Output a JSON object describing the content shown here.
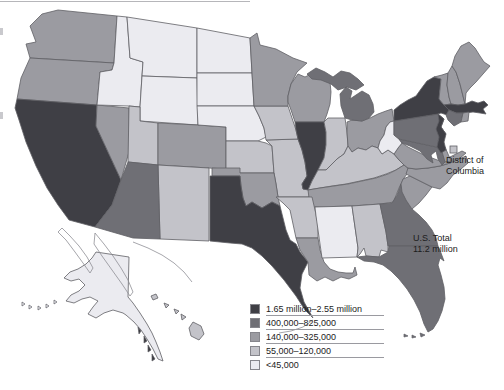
{
  "legend": {
    "items": [
      {
        "label": "1.65 million–2.55 million",
        "color": "#3f3f45"
      },
      {
        "label": "400,000–825,000",
        "color": "#6f6f75"
      },
      {
        "label": "140,000–325,000",
        "color": "#9b9ba1"
      },
      {
        "label": "55,000–120,000",
        "color": "#c3c3c9"
      },
      {
        "label": "<45,000",
        "color": "#ebebf0"
      }
    ]
  },
  "callouts": {
    "dc": {
      "line1": "District of",
      "line2": "Columbia"
    },
    "total": {
      "line1": "U.S. Total",
      "line2": "11.2 million"
    }
  },
  "map": {
    "stroke_color": "#5f5f65",
    "outline_color": "#8f8f95",
    "background": "#ffffff",
    "categories": {
      "CA": 1,
      "TX": 1,
      "NY": 1,
      "NJ": 1,
      "MA": 1,
      "IL": 1,
      "AZ": 2,
      "FL": 2,
      "GA": 2,
      "PA": 2,
      "MI": 2,
      "CT": 2,
      "MD": 2,
      "WA": 3,
      "OR": 3,
      "NV": 3,
      "CO": 3,
      "OK": 3,
      "MN": 3,
      "WI": 3,
      "OH": 3,
      "TN": 3,
      "VA": 3,
      "NC": 3,
      "SC": 3,
      "LA": 3,
      "ME": 3,
      "NH": 3,
      "VT": 3,
      "RI": 3,
      "DE": 3,
      "UT": 4,
      "NM": 4,
      "KS": 4,
      "IA": 4,
      "MO": 4,
      "IN": 4,
      "KY": 4,
      "AL": 4,
      "AR": 4,
      "DC": 4,
      "HI": 4,
      "MT": 5,
      "ID": 5,
      "WY": 5,
      "ND": 5,
      "SD": 5,
      "NE": 5,
      "WV": 5,
      "MS": 5,
      "AK": 5
    }
  }
}
